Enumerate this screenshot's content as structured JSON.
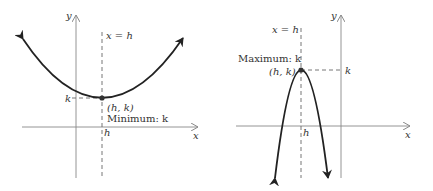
{
  "figures": [
    {
      "id": "left",
      "type": "upward-parabola",
      "axis_x_label": "x",
      "axis_y_label": "y",
      "axis_of_symmetry_label": "x = h",
      "vertex_label": "(h, k)",
      "extremum_label": "Minimum: k",
      "x_tick_label": "h",
      "y_tick_label": "k"
    },
    {
      "id": "right",
      "type": "downward-parabola",
      "axis_x_label": "x",
      "axis_y_label": "y",
      "axis_of_symmetry_label": "x = h",
      "vertex_label": "(h, k)",
      "extremum_label": "Maximum: k",
      "x_tick_label": "h",
      "y_tick_label": "k"
    }
  ],
  "colors": {
    "curve": "#222222",
    "axes": "#888888",
    "dashed": "#666666",
    "text": "#333333"
  }
}
